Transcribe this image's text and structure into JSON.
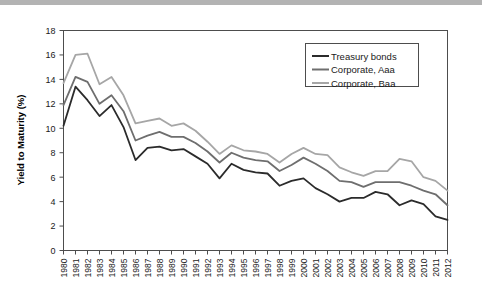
{
  "figure": {
    "background_color": "#ffffff",
    "top_rule_color": "#b3b3b3"
  },
  "chart_data": {
    "type": "line",
    "title": "",
    "xlabel": "",
    "ylabel": "Yield to Maturity (%)",
    "ylim": [
      0,
      18
    ],
    "ytick_step": 2,
    "yticks": [
      "0",
      "2",
      "4",
      "6",
      "8",
      "10",
      "12",
      "14",
      "16",
      "18"
    ],
    "grid": false,
    "legend_position": "upper right",
    "x": [
      "1980",
      "1981",
      "1982",
      "1983",
      "1984",
      "1985",
      "1986",
      "1987",
      "1988",
      "1989",
      "1990",
      "1991",
      "1992",
      "1993",
      "1994",
      "1995",
      "1996",
      "1997",
      "1998",
      "1999",
      "2000",
      "2001",
      "2002",
      "2003",
      "2004",
      "2005",
      "2006",
      "2007",
      "2008",
      "2009",
      "2010",
      "2011",
      "2012"
    ],
    "categories": [
      "1980",
      "1981",
      "1982",
      "1983",
      "1984",
      "1985",
      "1986",
      "1987",
      "1988",
      "1989",
      "1990",
      "1991",
      "1992",
      "1993",
      "1994",
      "1995",
      "1996",
      "1997",
      "1998",
      "1999",
      "2000",
      "2001",
      "2002",
      "2003",
      "2004",
      "2005",
      "2006",
      "2007",
      "2008",
      "2009",
      "2010",
      "2011",
      "2012"
    ],
    "series": [
      {
        "name": "Treasury bonds",
        "color": "#2b2b2b",
        "width": 1.8,
        "values": [
          10.2,
          13.4,
          12.3,
          11.0,
          11.9,
          10.1,
          7.4,
          8.4,
          8.5,
          8.2,
          8.3,
          7.7,
          7.1,
          5.9,
          7.1,
          6.6,
          6.4,
          6.3,
          5.3,
          5.7,
          5.9,
          5.1,
          4.6,
          4.0,
          4.3,
          4.3,
          4.8,
          4.6,
          3.7,
          4.1,
          3.8,
          2.8,
          2.5
        ]
      },
      {
        "name": "Corporate, Aaa",
        "color": "#6e6e6e",
        "width": 1.8,
        "values": [
          11.9,
          14.2,
          13.8,
          12.0,
          12.7,
          11.4,
          9.0,
          9.4,
          9.7,
          9.3,
          9.3,
          8.8,
          8.1,
          7.2,
          8.0,
          7.6,
          7.4,
          7.3,
          6.5,
          7.0,
          7.6,
          7.1,
          6.5,
          5.7,
          5.6,
          5.2,
          5.6,
          5.6,
          5.6,
          5.3,
          4.9,
          4.6,
          3.7
        ]
      },
      {
        "name": "Corporate, Baa",
        "color": "#a6a6a6",
        "width": 1.8,
        "values": [
          13.7,
          16.0,
          16.1,
          13.6,
          14.2,
          12.7,
          10.4,
          10.6,
          10.8,
          10.2,
          10.4,
          9.8,
          8.9,
          7.9,
          8.6,
          8.2,
          8.1,
          7.9,
          7.2,
          7.9,
          8.4,
          7.9,
          7.8,
          6.8,
          6.4,
          6.1,
          6.5,
          6.5,
          7.5,
          7.3,
          6.0,
          5.7,
          4.9
        ]
      }
    ],
    "legend": [
      {
        "label": "Treasury bonds",
        "color": "#2b2b2b"
      },
      {
        "label": "Corporate, Aaa",
        "color": "#6e6e6e"
      },
      {
        "label": "Corporate, Baa",
        "color": "#a6a6a6"
      }
    ]
  }
}
